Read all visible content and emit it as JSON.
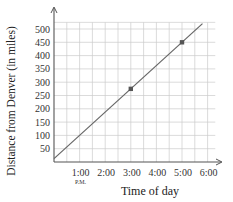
{
  "chart_data": {
    "type": "line",
    "title": "",
    "xlabel": "Time of day",
    "ylabel": "Distance from Denver (in miles)",
    "x_tick_labels": [
      "1:00",
      "2:00",
      "3:00",
      "4:00",
      "5:00",
      "6:00"
    ],
    "x_tick_sublabels": {
      "1:00": "P.M."
    },
    "x_ticks_hours_after_noon": [
      1,
      2,
      3,
      4,
      5,
      6
    ],
    "y_tick_labels": [
      "50",
      "100",
      "150",
      "200",
      "250",
      "300",
      "350",
      "400",
      "450",
      "500"
    ],
    "y_ticks": [
      50,
      100,
      150,
      200,
      250,
      300,
      350,
      400,
      450,
      500
    ],
    "xlim": [
      0,
      6
    ],
    "ylim": [
      0,
      500
    ],
    "grid": true,
    "series": [
      {
        "name": "Distance",
        "line": {
          "x": [
            0,
            5.8
          ],
          "y": [
            12.5,
            520
          ]
        },
        "marked_points": [
          {
            "x": 3,
            "x_label": "3:00",
            "y": 275
          },
          {
            "x": 5,
            "x_label": "5:00",
            "y": 450
          }
        ]
      }
    ],
    "colors": {
      "line": "#666666",
      "grid": "#cccccc",
      "axis": "#555555",
      "point": "#555555"
    }
  }
}
